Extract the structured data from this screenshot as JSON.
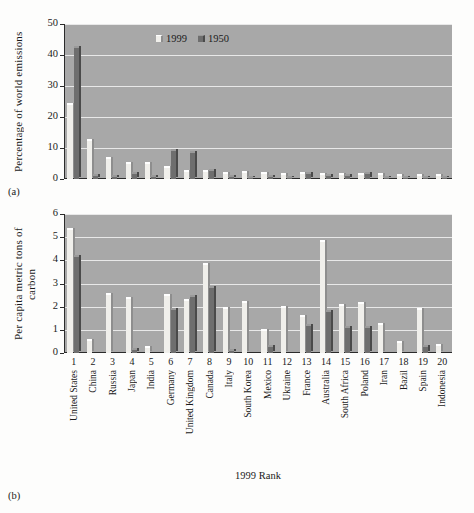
{
  "figure": {
    "subfig_a_label": "(a)",
    "subfig_b_label": "(b)",
    "xaxis_title": "1999 Rank"
  },
  "legend": {
    "position": "inside-top-center",
    "entries": [
      {
        "label": "1999",
        "color": "#f0efeb"
      },
      {
        "label": "1950",
        "color": "#6e6e6e"
      }
    ]
  },
  "chart_data": [
    {
      "type": "bar",
      "id": "panel-a",
      "title": "",
      "xlabel": "1999 Rank",
      "ylabel": "Percentage of world emissions",
      "ylim": [
        0,
        50
      ],
      "yticks": [
        0,
        10,
        20,
        30,
        40,
        50
      ],
      "grid": true,
      "legend": [
        "1999",
        "1950"
      ],
      "ranks": [
        1,
        2,
        3,
        4,
        5,
        6,
        7,
        8,
        9,
        10,
        11,
        12,
        13,
        14,
        15,
        16,
        17,
        18,
        19,
        20
      ],
      "categories": [
        "United States",
        "China",
        "Russia",
        "Japan",
        "India",
        "Germany",
        "United Kingdom",
        "Canada",
        "Italy",
        "South Korea",
        "Mexico",
        "Ukraine",
        "France",
        "Australia",
        "South Africa",
        "Poland",
        "Iran",
        "Bazil",
        "Spain",
        "Indonesia"
      ],
      "series": [
        {
          "name": "1999",
          "values": [
            24.0,
            12.3,
            6.4,
            4.8,
            4.9,
            3.4,
            2.3,
            2.2,
            1.7,
            1.9,
            1.5,
            1.4,
            1.5,
            1.3,
            1.3,
            1.4,
            1.2,
            1.1,
            1.0,
            1.0
          ]
        },
        {
          "name": "1950",
          "values": [
            42.3,
            1.0,
            0.7,
            1.5,
            0.5,
            9.0,
            8.3,
            2.7,
            0.5,
            0.1,
            0.6,
            0.4,
            1.6,
            0.9,
            1.0,
            1.6,
            0.2,
            0.4,
            0.3,
            0.2
          ]
        }
      ]
    },
    {
      "type": "bar",
      "id": "panel-b",
      "title": "",
      "xlabel": "1999 Rank",
      "ylabel": "Per capita metric tons of carbon",
      "ylim": [
        0,
        6
      ],
      "yticks": [
        0,
        1,
        2,
        3,
        4,
        5,
        6
      ],
      "grid": true,
      "legend": [
        "1999",
        "1950"
      ],
      "ranks": [
        1,
        2,
        3,
        4,
        5,
        6,
        7,
        8,
        9,
        10,
        11,
        12,
        13,
        14,
        15,
        16,
        17,
        18,
        19,
        20
      ],
      "categories": [
        "United States",
        "China",
        "Russia",
        "Japan",
        "India",
        "Germany",
        "United Kingdom",
        "Canada",
        "Italy",
        "South Korea",
        "Mexico",
        "Ukraine",
        "France",
        "Australia",
        "South Africa",
        "Poland",
        "Iran",
        "Bazil",
        "Spain",
        "Indonesia"
      ],
      "series": [
        {
          "name": "1999",
          "values": [
            5.3,
            0.5,
            2.5,
            2.35,
            0.2,
            2.45,
            2.25,
            3.8,
            1.9,
            2.15,
            0.95,
            1.95,
            1.55,
            4.8,
            2.05,
            2.1,
            1.2,
            0.45,
            1.85,
            0.3
          ]
        },
        {
          "name": "1950",
          "values": [
            4.15,
            0.0,
            0.0,
            0.15,
            0.0,
            1.85,
            2.4,
            2.8,
            0.1,
            0.0,
            0.25,
            0.0,
            1.15,
            1.75,
            1.1,
            1.1,
            0.0,
            0.0,
            0.25,
            0.0
          ]
        }
      ]
    }
  ]
}
